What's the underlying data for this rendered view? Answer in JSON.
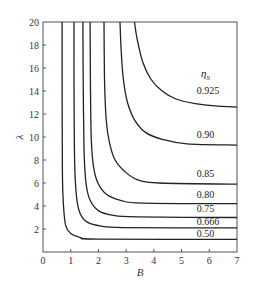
{
  "chart_data": {
    "type": "line",
    "title": "",
    "xlabel": "B",
    "ylabel": "λ",
    "xlim": [
      0,
      7
    ],
    "ylim": [
      0,
      20
    ],
    "xticks": [
      0,
      1,
      2,
      3,
      4,
      5,
      6,
      7
    ],
    "xtick_labels": [
      "0",
      "1",
      "2",
      "3",
      "4",
      "5",
      "6",
      "7"
    ],
    "yticks": [
      2,
      4,
      6,
      8,
      10,
      12,
      14,
      16,
      18,
      20
    ],
    "ytick_labels": [
      "2",
      "4",
      "6",
      "8",
      "10",
      "12",
      "14",
      "16",
      "18",
      "20"
    ],
    "grid": false,
    "legend": {
      "title": "η",
      "title_subscript": "S",
      "position": "inline curve labels, right side"
    },
    "series": [
      {
        "name": "0.925",
        "label": "0.925",
        "x": [
          3.3,
          3.4,
          3.6,
          3.9,
          4.3,
          4.8,
          5.5,
          6.2,
          7.0
        ],
        "y": [
          20,
          18.5,
          16.5,
          15.0,
          14.0,
          13.3,
          12.9,
          12.7,
          12.6
        ]
      },
      {
        "name": "0.90",
        "label": "0.90",
        "x": [
          2.78,
          2.82,
          2.9,
          3.05,
          3.3,
          3.7,
          4.3,
          5.2,
          7.0
        ],
        "y": [
          20,
          17.5,
          15.0,
          13.0,
          11.5,
          10.4,
          9.8,
          9.4,
          9.3
        ]
      },
      {
        "name": "0.85",
        "label": "0.85",
        "x": [
          2.2,
          2.22,
          2.28,
          2.4,
          2.6,
          2.95,
          3.4,
          4.2,
          7.0
        ],
        "y": [
          20,
          15.0,
          11.5,
          9.5,
          8.0,
          7.0,
          6.3,
          6.0,
          5.9
        ]
      },
      {
        "name": "0.80",
        "label": "0.80",
        "x": [
          1.7,
          1.71,
          1.74,
          1.82,
          1.98,
          2.3,
          2.8,
          3.6,
          7.0
        ],
        "y": [
          20,
          15.0,
          10.0,
          7.5,
          6.0,
          5.0,
          4.5,
          4.25,
          4.2
        ]
      },
      {
        "name": "0.75",
        "label": "0.75",
        "x": [
          1.44,
          1.45,
          1.48,
          1.55,
          1.7,
          2.0,
          2.5,
          3.4,
          7.0
        ],
        "y": [
          20,
          15.0,
          9.0,
          6.0,
          4.5,
          3.6,
          3.2,
          3.05,
          3.0
        ]
      },
      {
        "name": "0.666",
        "label": "0.666",
        "x": [
          1.12,
          1.12,
          1.14,
          1.2,
          1.33,
          1.6,
          2.1,
          2.9,
          7.0
        ],
        "y": [
          20,
          15.0,
          8.0,
          5.0,
          3.4,
          2.6,
          2.25,
          2.12,
          2.1
        ]
      },
      {
        "name": "0.50",
        "label": "0.50",
        "x": [
          0.69,
          0.69,
          0.7,
          0.74,
          0.82,
          1.0,
          1.35,
          2.0,
          7.0
        ],
        "y": [
          20,
          15.0,
          7.0,
          4.0,
          2.3,
          1.6,
          1.25,
          1.12,
          1.1
        ]
      }
    ],
    "curve_label_positions": [
      {
        "label": "0.925",
        "x": 5.55,
        "y": 13.7
      },
      {
        "label": "0.90",
        "x": 5.55,
        "y": 9.9
      },
      {
        "label": "0.85",
        "x": 5.55,
        "y": 6.5
      },
      {
        "label": "0.80",
        "x": 5.55,
        "y": 4.7
      },
      {
        "label": "0.75",
        "x": 5.55,
        "y": 3.45
      },
      {
        "label": "0.666",
        "x": 5.55,
        "y": 2.35
      },
      {
        "label": "0.50",
        "x": 5.55,
        "y": 1.3
      }
    ],
    "legend_title_position": {
      "x": 5.7,
      "y": 15.2
    }
  }
}
